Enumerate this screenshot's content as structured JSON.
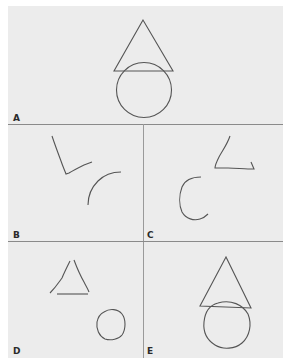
{
  "figure": {
    "background": "#ececec",
    "stroke_color": "#555555",
    "panels": [
      {
        "id": "A",
        "label": "A",
        "description": "Model drawing: triangle above overlapping circle"
      },
      {
        "id": "B",
        "label": "B",
        "description": "Fragmented strokes: angular line and arc, disorganized"
      },
      {
        "id": "C",
        "label": "C",
        "description": "Partial triangle corner and open C-shaped arc"
      },
      {
        "id": "D",
        "label": "D",
        "description": "Separate triangle and circle, not overlapping"
      },
      {
        "id": "E",
        "label": "E",
        "description": "Complete copy: triangle overlapping circle"
      }
    ]
  }
}
